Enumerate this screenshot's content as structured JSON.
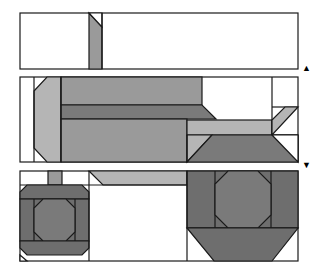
{
  "caption": "",
  "colors": {
    "outline": "#1a1a1a",
    "light": "#b5b5b5",
    "mid": "#9a9a9a",
    "dark": "#7a7a7a",
    "darkest": "#6e6e6e",
    "background": "#ffffff"
  },
  "panels": [
    {
      "name": "panel-top",
      "x": 20,
      "y": 13,
      "w": 278,
      "h": 56
    },
    {
      "name": "panel-middle",
      "x": 20,
      "y": 77,
      "w": 278,
      "h": 85
    },
    {
      "name": "panel-bottom",
      "x": 20,
      "y": 171,
      "w": 278,
      "h": 90
    }
  ],
  "arrows": {
    "up": "▲",
    "down": "▼"
  }
}
